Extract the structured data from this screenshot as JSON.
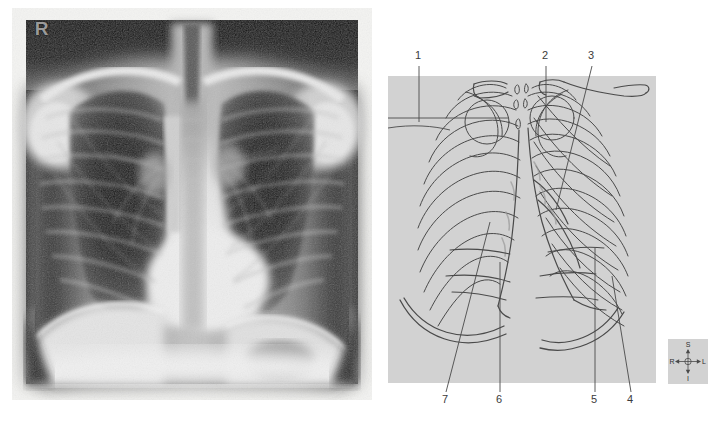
{
  "figure": {
    "type": "medical-imaging-figure",
    "panels": 2
  },
  "xray": {
    "side_marker": "R",
    "marker_meaning": "right",
    "projection": "PA chest",
    "background_color": "#0a0a0a",
    "soft_tissue_color": "#c9c9c9"
  },
  "diagram": {
    "plate_color": "#d2d2d2",
    "ink_color": "#3b3b3b",
    "callouts": [
      {
        "id": "1",
        "label": "1",
        "x": 28,
        "y": 56,
        "leader": "vertical-then-horizontal-left"
      },
      {
        "id": "2",
        "label": "2",
        "x": 155,
        "y": 56,
        "leader": "vertical-down"
      },
      {
        "id": "3",
        "label": "3",
        "x": 201,
        "y": 56,
        "leader": "diagonal-down-left"
      },
      {
        "id": "4",
        "label": "4",
        "x": 239,
        "y": 400,
        "leader": "diagonal-up-left"
      },
      {
        "id": "5",
        "label": "5",
        "x": 203,
        "y": 400,
        "leader": "vertical-up"
      },
      {
        "id": "6",
        "label": "6",
        "x": 109,
        "y": 400,
        "leader": "vertical-up"
      },
      {
        "id": "7",
        "label": "7",
        "x": 52,
        "y": 400,
        "leader": "diagonal-up-right"
      }
    ]
  },
  "compass": {
    "name": "anatomical-orientation-indicator",
    "superior": "S",
    "inferior": "I",
    "right": "R",
    "left": "L",
    "background_color": "#d2d2d2"
  }
}
